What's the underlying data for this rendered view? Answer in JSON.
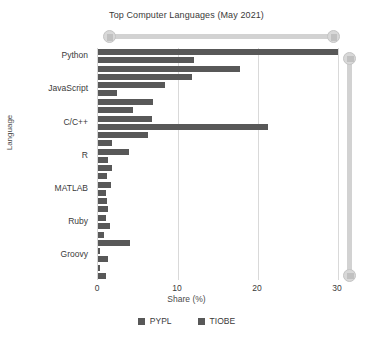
{
  "chart_data": {
    "type": "bar",
    "orientation": "horizontal",
    "title": "Top Computer Languages (May 2021)",
    "xlabel": "Share (%)",
    "ylabel": "Language",
    "xlim": [
      0,
      30
    ],
    "xticks": [
      0,
      10,
      20,
      30
    ],
    "xtick_labels": [
      "0",
      "10",
      "20",
      "30"
    ],
    "grid": "vertical",
    "legend_position": "bottom",
    "bar_color": "#585858",
    "categories": [
      "Python",
      "Java",
      "JavaScript",
      "C#",
      "C/C++",
      "PHP",
      "R",
      "Objective-C",
      "MATLAB",
      "Swift",
      "Ruby",
      "TypeScript",
      "Groovy",
      "Rust"
    ],
    "visible_category_labels": [
      "Python",
      "JavaScript",
      "C/C++",
      "R",
      "MATLAB",
      "Ruby",
      "Groovy"
    ],
    "series": [
      {
        "name": "PYPL",
        "color": "#585858",
        "values": [
          30.0,
          17.8,
          8.4,
          6.9,
          6.7,
          6.2,
          3.9,
          1.7,
          1.6,
          1.1,
          1.0,
          0.7,
          0.3,
          0.3
        ]
      },
      {
        "name": "TIOBE",
        "color": "#585858",
        "values": [
          12.0,
          11.8,
          2.4,
          4.4,
          21.2,
          1.8,
          1.3,
          1.1,
          1.0,
          1.2,
          1.5,
          4.0,
          1.2,
          1.0
        ]
      }
    ]
  },
  "legend": {
    "items": [
      {
        "label": "PYPL",
        "color": "#585858"
      },
      {
        "label": "TIOBE",
        "color": "#585858"
      }
    ]
  },
  "controls": {
    "horizontal_slider": {
      "name": "horizontal-range-slider",
      "left_value": "0",
      "right_value": "30"
    },
    "vertical_slider": {
      "name": "vertical-range-slider",
      "top_value": "top",
      "bottom_value": "bottom"
    }
  }
}
